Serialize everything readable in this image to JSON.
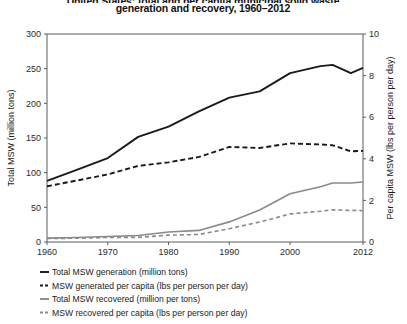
{
  "chart_data": {
    "type": "line",
    "title": "United States: total and per capita municipal solid waste generation and recovery, 1960–2012",
    "title_line_1": "United States: total and per capita municipal solid waste",
    "title_line_2": "generation and recovery, 1960–2012",
    "xlabel": "",
    "ylabel": "Total MSW (million tons)",
    "y2label": "Per capita MSW (lbs per person per day)",
    "xlim": [
      1960,
      2012
    ],
    "ylim": [
      0,
      300
    ],
    "y2lim": [
      0,
      10
    ],
    "xticks": [
      1960,
      1970,
      1980,
      1990,
      2000,
      2012
    ],
    "xtick_labels": [
      "1960",
      "1970",
      "1980",
      "1990",
      "2000",
      "2012"
    ],
    "yticks": [
      0,
      50,
      100,
      150,
      200,
      250,
      300
    ],
    "ytick_labels": [
      "0",
      "50",
      "100",
      "150",
      "200",
      "250",
      "300"
    ],
    "y2ticks": [
      0,
      2,
      4,
      6,
      8,
      10
    ],
    "y2tick_labels": [
      "0",
      "2",
      "4",
      "6",
      "8",
      "10"
    ],
    "grid": false,
    "legend_position": "below",
    "x": [
      1960,
      1965,
      1970,
      1975,
      1980,
      1985,
      1990,
      1995,
      2000,
      2005,
      2007,
      2010,
      2012
    ],
    "series": [
      {
        "name": "Total MSW generation (million tons)",
        "axis": "left",
        "color": "#1a1a1a",
        "style": "solid",
        "width": 1.9,
        "values": [
          88.1,
          104.4,
          121.1,
          151.6,
          166.3,
          188.3,
          208.3,
          217.3,
          243.5,
          253.7,
          255.4,
          243.6,
          251.0
        ]
      },
      {
        "name": "MSW generated per capita (lbs per person per day)",
        "axis": "right",
        "color": "#1a1a1a",
        "style": "dashed",
        "width": 1.9,
        "values": [
          2.68,
          2.96,
          3.25,
          3.66,
          3.83,
          4.09,
          4.57,
          4.52,
          4.74,
          4.69,
          4.65,
          4.36,
          4.38
        ]
      },
      {
        "name": "Total MSW recovered (million per tons)",
        "axis": "left",
        "color": "#8a8a8a",
        "style": "solid",
        "width": 1.6,
        "values": [
          5.6,
          6.4,
          8.0,
          9.3,
          14.5,
          16.7,
          29.0,
          46.1,
          69.5,
          79.8,
          85.0,
          85.1,
          86.6
        ]
      },
      {
        "name": "MSW recovered per capita (lbs per person per day)",
        "axis": "right",
        "color": "#8a8a8a",
        "style": "dashed",
        "width": 1.6,
        "values": [
          0.17,
          0.18,
          0.22,
          0.22,
          0.33,
          0.36,
          0.64,
          0.96,
          1.35,
          1.48,
          1.55,
          1.52,
          1.51
        ]
      }
    ],
    "legend": [
      {
        "label": "Total MSW generation (million tons)",
        "color": "#1a1a1a",
        "style": "solid"
      },
      {
        "label": "MSW generated per capita (lbs per person per day)",
        "color": "#1a1a1a",
        "style": "dashed"
      },
      {
        "label": "Total MSW recovered (million per tons)",
        "color": "#8a8a8a",
        "style": "solid"
      },
      {
        "label": "MSW recovered per capita (lbs per person per day)",
        "color": "#8a8a8a",
        "style": "dashed"
      }
    ]
  }
}
